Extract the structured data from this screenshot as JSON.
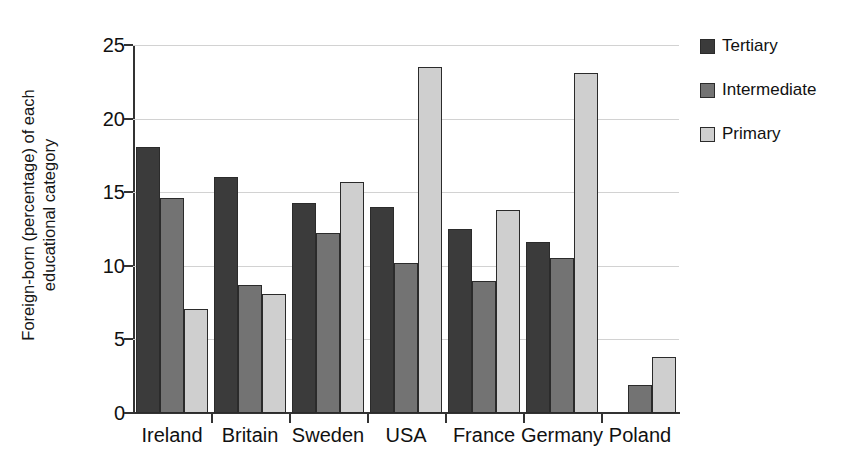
{
  "chart_data": {
    "type": "bar",
    "title": "",
    "xlabel": "",
    "ylabel": "Foreign-born (percentage) of each educational category",
    "ylabel_line1": "Foreign-born (percentage) of each",
    "ylabel_line2": "educational category",
    "ylim": [
      0,
      25
    ],
    "ytick_labels": [
      "0",
      "5",
      "10",
      "15",
      "20",
      "25"
    ],
    "ytick_values": [
      0,
      5,
      10,
      15,
      20,
      25
    ],
    "grid": "horizontal",
    "legend_position": "right",
    "categories": [
      "Ireland",
      "Britain",
      "Sweden",
      "USA",
      "France",
      "Germany",
      "Poland"
    ],
    "series": [
      {
        "name": "Tertiary",
        "color": "#3b3b3b",
        "values": [
          18.1,
          16.0,
          14.3,
          14.0,
          12.5,
          11.6,
          0.0
        ]
      },
      {
        "name": "Intermediate",
        "color": "#737373",
        "values": [
          14.6,
          8.7,
          12.2,
          10.2,
          9.0,
          10.5,
          1.9
        ]
      },
      {
        "name": "Primary",
        "color": "#cfcfcf",
        "values": [
          7.1,
          8.1,
          15.7,
          23.5,
          13.8,
          23.1,
          3.8
        ]
      }
    ]
  }
}
